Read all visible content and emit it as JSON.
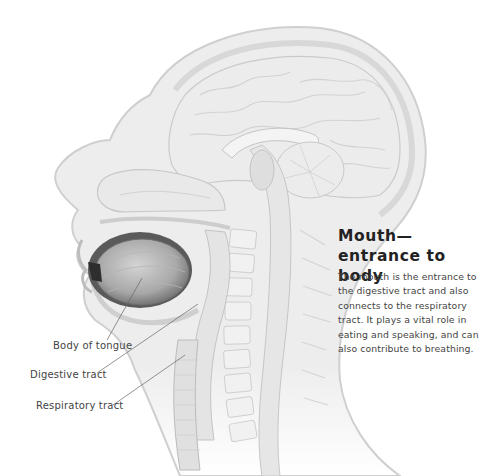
{
  "illustration": {
    "subject": "sagittal-section-head-and-neck",
    "colors": {
      "background": "#ffffff",
      "tissue": "#efefef",
      "outline": "#c8c8c8",
      "tongue": "#9a9a9a",
      "leader_line": "#555555",
      "heading": "#222222",
      "text": "#444444"
    }
  },
  "labels": [
    {
      "id": "body-of-tongue",
      "text": "Body of tongue"
    },
    {
      "id": "digestive-tract",
      "text": "Digestive tract"
    },
    {
      "id": "respiratory-tract",
      "text": "Respiratory tract"
    }
  ],
  "caption": {
    "title_line1": "Mouth—",
    "title_line2": "entrance to body",
    "body_lines": [
      "The mouth is the entrance to",
      "the digestive tract and also",
      "connects to the respiratory",
      "tract. It plays a vital role in",
      "eating and speaking, and can",
      "also contribute to breathing."
    ]
  }
}
